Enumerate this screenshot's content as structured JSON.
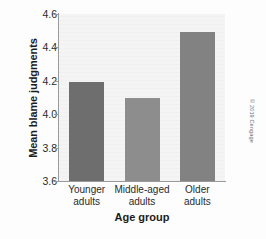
{
  "chart_data": {
    "type": "bar",
    "title": "",
    "categories": [
      "Younger adults",
      "Middle-aged adults",
      "Older adults"
    ],
    "category_lines": [
      [
        "Younger",
        "adults"
      ],
      [
        "Middle-aged",
        "adults"
      ],
      [
        "Older",
        "adults"
      ]
    ],
    "values": [
      4.19,
      4.1,
      4.49
    ],
    "xlabel": "Age group",
    "ylabel": "Mean blame judgments",
    "ylim": [
      3.6,
      4.6
    ],
    "ytick_labels": [
      "3.6",
      "3.8",
      "4.0",
      "4.2",
      "4.4",
      "4.6"
    ],
    "ytick_values": [
      3.6,
      3.8,
      4.0,
      4.2,
      4.4,
      4.6
    ],
    "grid": false,
    "legend": "none",
    "bar_colors": [
      "#6e6e6e",
      "#8d8d8d",
      "#828282"
    ],
    "plot_background": "#f4f4f4",
    "axis_color": "#9a9a9a"
  },
  "credit": {
    "text": "© 2019 Cengage"
  }
}
